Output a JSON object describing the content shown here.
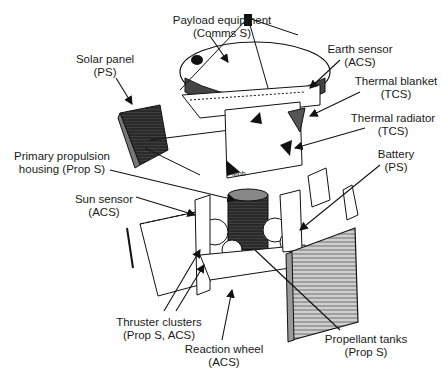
{
  "figure": {
    "background": "#ffffff",
    "line_color": "#111111"
  },
  "labels": [
    {
      "id": "payload",
      "line1": "Payload equipment",
      "line2": "(Comms S)",
      "x": 222,
      "y": 14
    },
    {
      "id": "solar-panel",
      "line1": "Solar panel",
      "line2": "(PS)",
      "x": 105,
      "y": 53
    },
    {
      "id": "earth-sensor",
      "line1": "Earth sensor",
      "line2": "(ACS)",
      "x": 360,
      "y": 43
    },
    {
      "id": "thermal-blanket",
      "line1": "Thermal blanket",
      "line2": "(TCS)",
      "x": 396,
      "y": 75
    },
    {
      "id": "thermal-radiator",
      "line1": "Thermal radiator",
      "line2": "(TCS)",
      "x": 393,
      "y": 112
    },
    {
      "id": "primary-propulsion",
      "line1": "Primary propulsion",
      "line2": "housing (Prop S)",
      "x": 62,
      "y": 150
    },
    {
      "id": "battery",
      "line1": "Battery",
      "line2": "(PS)",
      "x": 396,
      "y": 148
    },
    {
      "id": "sun-sensor",
      "line1": "Sun sensor",
      "line2": "(ACS)",
      "x": 104,
      "y": 193
    },
    {
      "id": "thruster-clusters",
      "line1": "Thruster clusters",
      "line2": "(Prop S, ACS)",
      "x": 159,
      "y": 316
    },
    {
      "id": "reaction-wheel",
      "line1": "Reaction wheel",
      "line2": "(ACS)",
      "x": 224,
      "y": 343
    },
    {
      "id": "propellant-tanks",
      "line1": "Propellant tanks",
      "line2": "(Prop S)",
      "x": 366,
      "y": 333
    }
  ],
  "subsystem_legend": {
    "Comms S": "Communications subsystem",
    "PS": "Power subsystem",
    "ACS": "Attitude control subsystem",
    "TCS": "Thermal control subsystem",
    "Prop S": "Propulsion subsystem"
  }
}
